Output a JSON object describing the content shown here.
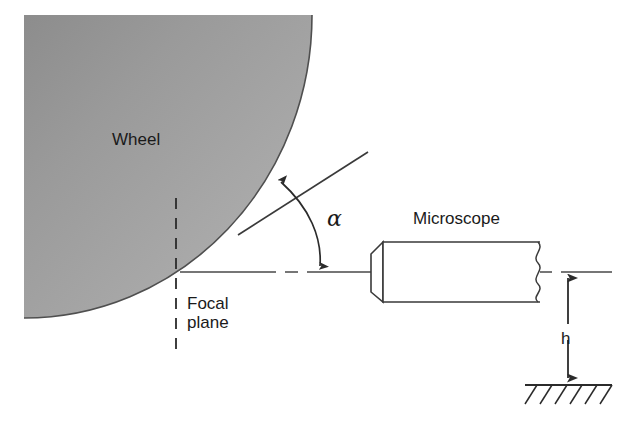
{
  "figure": {
    "background_color": "#ffffff",
    "line_color": "#333333",
    "text_color": "#1a1a1a",
    "width": 629,
    "height": 427
  },
  "labels": {
    "wheel": "Wheel",
    "focal_plane": "Focal\nplane",
    "microscope": "Microscope",
    "angle_alpha": "α",
    "height_h": "h"
  },
  "parts": {
    "wheel": {
      "name": "Wheel",
      "shape": "quarter-circle-shaded",
      "gradient_dark": "#6e6e6e",
      "gradient_light": "#b0b0b0",
      "outline_color": "#4a4a4a",
      "center_x": 24,
      "center_y": 15,
      "radius_x": 288,
      "radius_y": 303,
      "tangent_point_x": 180,
      "tangent_point_y": 272
    },
    "focal_plane_line": {
      "name": "Focal plane",
      "style": "dashed-vertical",
      "x": 176,
      "y_top": 198,
      "y_bottom": 356
    },
    "optical_axis": {
      "name": "Optical axis centerline",
      "style": "dash-dot-horizontal",
      "y": 272,
      "x_start": 180,
      "x_end": 612
    },
    "tangent_line": {
      "name": "Tangent / inclined reference line",
      "style": "solid",
      "x1": 238,
      "y1": 235,
      "x2": 368,
      "y2": 152
    },
    "angle_arc": {
      "name": "Angle alpha arc",
      "style": "double-headed-curved-arrow",
      "from_x": 277,
      "from_y": 178,
      "to_x": 318,
      "to_y": 272
    },
    "microscope": {
      "name": "Microscope",
      "body_x": 383,
      "body_y": 242,
      "body_width": 157,
      "body_height": 60,
      "objective_x": 371,
      "objective_taper": 12,
      "objective_height": 44,
      "break_line": "wavy",
      "break_x": 538
    },
    "height_dimension": {
      "name": "Height h",
      "symbol": "h",
      "style": "double-headed-vertical-arrow",
      "x": 568,
      "y_top": 272,
      "y_bottom": 384
    },
    "ground": {
      "name": "Ground / datum",
      "style": "hatched-line",
      "x_start": 525,
      "x_end": 612,
      "y": 385,
      "hatch_count": 6
    }
  }
}
